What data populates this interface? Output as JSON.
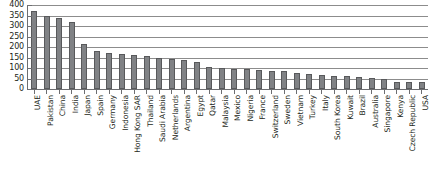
{
  "chart_data": {
    "type": "bar",
    "title": "",
    "subtitle": "",
    "xlabel": "",
    "ylabel": "",
    "ylim": [
      0,
      400
    ],
    "yticks": [
      0,
      50,
      100,
      150,
      200,
      250,
      300,
      350,
      400
    ],
    "grid": true,
    "legend": false,
    "bar_color": "#808285",
    "bar_edge_color": "#58595b",
    "axis_color": "#6d6e71",
    "gridline_color": "#8c8c8c",
    "text_color": "#231f20",
    "categories": [
      "UAE",
      "Pakistan",
      "China",
      "India",
      "Japan",
      "Spain",
      "Germany",
      "Indonesia",
      "Hong Kong SAR",
      "Thailand",
      "Saudi Arabia",
      "Netherlands",
      "Argentina",
      "Egypt",
      "Qatar",
      "Malaysia",
      "Mexico",
      "Nigeria",
      "France",
      "Switzerland",
      "Sweden",
      "Vietnam",
      "Turkey",
      "Italy",
      "South Korea",
      "Kuwait",
      "Brazil",
      "Australia",
      "Singapore",
      "Kenya",
      "Czech Republic",
      "USA"
    ],
    "values": [
      372,
      348,
      338,
      318,
      216,
      180,
      170,
      168,
      160,
      155,
      147,
      144,
      139,
      127,
      104,
      100,
      97,
      93,
      90,
      88,
      85,
      78,
      70,
      66,
      62,
      60,
      58,
      51,
      46,
      35,
      33,
      32
    ]
  }
}
